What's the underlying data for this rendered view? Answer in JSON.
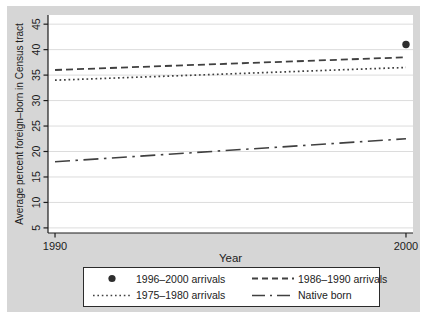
{
  "figure": {
    "background": "#d6d6d6",
    "plot_background": "#ffffff",
    "gridline_color": "#dcdcdc",
    "axis_color": "#1c1c1c",
    "line_color": "#404040",
    "marker_color": "#2e2e2e"
  },
  "chart_data": {
    "type": "line",
    "title": "",
    "xlabel": "Year",
    "ylabel": "Average percent foreign–born in Census tract",
    "xlim": [
      1989.8,
      2000.2
    ],
    "ylim": [
      4.0,
      46.8
    ],
    "xticks": [
      1990,
      2000
    ],
    "yticks": [
      5,
      10,
      15,
      20,
      25,
      30,
      35,
      40,
      45
    ],
    "grid": true,
    "x": [
      1990,
      2000
    ],
    "series": [
      {
        "name": "1996–2000 arrivals",
        "style": "marker",
        "values": [
          null,
          41
        ]
      },
      {
        "name": "1986–1990 arrivals",
        "style": "dash",
        "values": [
          36,
          38.5
        ]
      },
      {
        "name": "1975–1980 arrivals",
        "style": "dot",
        "values": [
          34,
          36.5
        ]
      },
      {
        "name": "Native born",
        "style": "dashdot",
        "values": [
          18,
          22.5
        ]
      }
    ],
    "legend": {
      "position": "bottom",
      "framed": true,
      "columns": 2
    }
  }
}
